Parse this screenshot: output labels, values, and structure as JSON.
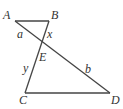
{
  "diagram": {
    "type": "geometry",
    "colors": {
      "line": "#444444",
      "text": "#333333",
      "background": "#ffffff"
    },
    "points": {
      "A": {
        "label": "A",
        "x": 15,
        "y": 21
      },
      "B": {
        "label": "B",
        "x": 49,
        "y": 21
      },
      "E": {
        "label": "E",
        "x": 41,
        "y": 42
      },
      "C": {
        "label": "C",
        "x": 25,
        "y": 93
      },
      "D": {
        "label": "D",
        "x": 110,
        "y": 93
      }
    },
    "segments": [
      {
        "from": "A",
        "to": "B"
      },
      {
        "from": "A",
        "to": "D"
      },
      {
        "from": "B",
        "to": "C"
      },
      {
        "from": "C",
        "to": "D"
      }
    ],
    "segment_labels": {
      "a": {
        "text": "a",
        "segment": "AE"
      },
      "x": {
        "text": "x",
        "segment": "BE"
      },
      "y": {
        "text": "y",
        "segment": "EC"
      },
      "b": {
        "text": "b",
        "segment": "ED"
      }
    }
  }
}
